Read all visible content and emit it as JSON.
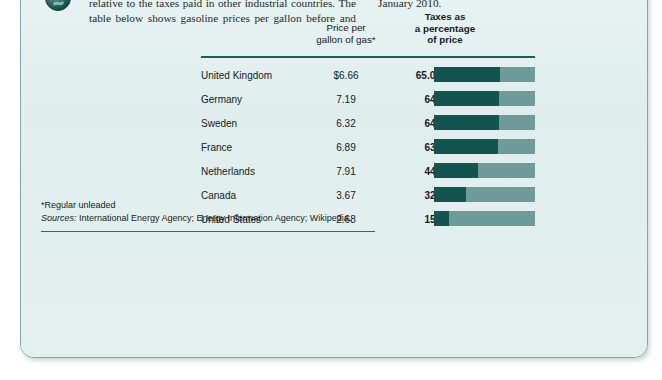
{
  "card": {
    "background_color": "#e2efee",
    "border_color": "#7fa8a6"
  },
  "intro": {
    "icon": "globe-icon",
    "lead_italic": "Are",
    "paragraph": " our gas taxes too high? They certainly are not too high relative to the taxes paid in other industrial countries. The table below shows gasoline prices per gallon before and after taxes in selected industrial countries for the month of January 2010."
  },
  "table": {
    "headers": {
      "country": "",
      "price": "Price per gallon of gas*",
      "price_line1": "Price per",
      "price_line2": "gallon of gas*",
      "percent_line1": "Taxes as",
      "percent_line2": "a percentage",
      "percent_line3": "of price"
    },
    "rows": [
      {
        "country": "United Kingdom",
        "price": "$6.66",
        "percent_label": "65.0%",
        "percent_value": 65
      },
      {
        "country": "Germany",
        "price": "7.19",
        "percent_label": "64",
        "percent_value": 64
      },
      {
        "country": "Sweden",
        "price": "6.32",
        "percent_label": "64",
        "percent_value": 64
      },
      {
        "country": "France",
        "price": "6.89",
        "percent_label": "63",
        "percent_value": 63
      },
      {
        "country": "Netherlands",
        "price": "7.91",
        "percent_label": "44",
        "percent_value": 44
      },
      {
        "country": "Canada",
        "price": "3.67",
        "percent_label": "32",
        "percent_value": 32
      },
      {
        "country": "United States",
        "price": "2.68",
        "percent_label": "15",
        "percent_value": 15
      }
    ]
  },
  "notes": {
    "footnote": "*Regular unleaded",
    "sources_label": "Sources:",
    "sources_text": " International Energy Agency; Energy Information Agency; Wikipedia."
  },
  "chart_data": {
    "type": "bar",
    "title": "Taxes as a percentage of price",
    "xlabel": "Taxes as a percentage of price",
    "ylabel": "",
    "orientation": "horizontal",
    "xlim": [
      0,
      100
    ],
    "grid": false,
    "legend": false,
    "bar_fill_color": "#12544e",
    "bar_track_color": "#6e9a97",
    "categories": [
      "United Kingdom",
      "Germany",
      "Sweden",
      "France",
      "Netherlands",
      "Canada",
      "United States"
    ],
    "values": [
      65,
      64,
      64,
      63,
      44,
      32,
      15
    ],
    "series": [
      {
        "name": "Taxes as a percentage of price",
        "values": [
          65,
          64,
          64,
          63,
          44,
          32,
          15
        ]
      },
      {
        "name": "Price per gallon of gas (USD)",
        "values": [
          6.66,
          7.19,
          6.32,
          6.89,
          7.91,
          3.67,
          2.68
        ]
      }
    ],
    "data_labels": [
      "65.0%",
      "64",
      "64",
      "63",
      "44",
      "32",
      "15"
    ]
  }
}
